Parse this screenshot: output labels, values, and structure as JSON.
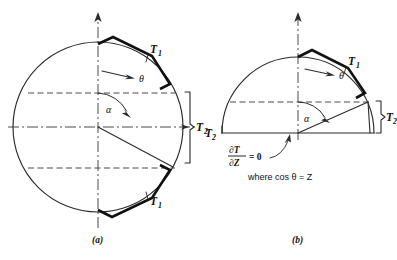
{
  "figure": {
    "panels": [
      {
        "id": "a",
        "caption": "(a)",
        "shape": "full-circle",
        "center": {
          "x": 98,
          "y": 127
        },
        "radius": 85,
        "labels": {
          "t1_upper": {
            "base": "T",
            "sub": "1"
          },
          "t1_lower": {
            "base": "T",
            "sub": "1"
          },
          "t2_right": {
            "base": "T",
            "sub": "2"
          },
          "theta": "θ",
          "alpha": "α"
        },
        "angles": {
          "alpha_from_vertical_deg": 62,
          "t1_band_start_deg": 8,
          "t1_band_end_deg": 62
        }
      },
      {
        "id": "b",
        "caption": "(b)",
        "shape": "half-circle",
        "center": {
          "x": 298,
          "y": 133
        },
        "radius": 76,
        "labels": {
          "t1_upper": {
            "base": "T",
            "sub": "1"
          },
          "t2_right": {
            "base": "T",
            "sub": "2"
          },
          "t2_left": {
            "base": "T",
            "sub": "2"
          },
          "theta": "θ",
          "alpha": "α"
        },
        "equation": {
          "numerator": "∂T",
          "denominator": "∂Z",
          "rhs": "= 0"
        },
        "note": "where cos θ = Z",
        "angles": {
          "alpha_from_vertical_deg": 62,
          "t1_band_start_deg": 8,
          "t1_band_end_deg": 62
        }
      }
    ],
    "colors": {
      "outline": "#2b2b2b",
      "band": "#111111",
      "axis": "#4a4a4a",
      "background": "#ffffff"
    }
  }
}
